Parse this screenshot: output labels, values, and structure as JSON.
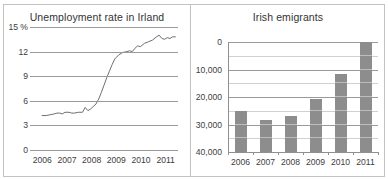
{
  "chart_data": [
    {
      "type": "line",
      "title": "Unemployment rate in Irland",
      "xlabel": "",
      "ylabel": "15 %",
      "ylim": [
        0,
        15
      ],
      "yticks": [
        0,
        3,
        6,
        9,
        12,
        15
      ],
      "ytick_labels": [
        "0",
        "3",
        "6",
        "9",
        "12",
        "15 %"
      ],
      "xlim": [
        2006,
        2011.5
      ],
      "xtick_labels": [
        "2006",
        "2007",
        "2008",
        "2009",
        "2010",
        "2011"
      ],
      "grid": true,
      "legend": "none",
      "series": [
        {
          "name": "Unemployment rate",
          "x": [
            2006.45,
            2006.6,
            2006.75,
            2006.9,
            2007.0,
            2007.1,
            2007.2,
            2007.3,
            2007.45,
            2007.55,
            2007.65,
            2007.8,
            2007.95,
            2008.05,
            2008.15,
            2008.25,
            2008.35,
            2008.45,
            2008.55,
            2008.65,
            2008.75,
            2008.85,
            2008.95,
            2009.05,
            2009.15,
            2009.3,
            2009.45,
            2009.6,
            2009.7,
            2009.8,
            2009.9,
            2010.0,
            2010.1,
            2010.25,
            2010.4,
            2010.55,
            2010.7,
            2010.8,
            2010.9,
            2011.0,
            2011.1,
            2011.2,
            2011.3,
            2011.4
          ],
          "y": [
            4.2,
            4.2,
            4.3,
            4.4,
            4.5,
            4.5,
            4.4,
            4.6,
            4.6,
            4.5,
            4.5,
            4.6,
            4.6,
            5.2,
            4.8,
            5.0,
            5.3,
            5.6,
            6.2,
            7.0,
            7.9,
            8.8,
            9.6,
            10.4,
            11.1,
            11.6,
            11.9,
            12.0,
            12.1,
            12.0,
            12.4,
            12.7,
            12.6,
            13.0,
            13.2,
            13.4,
            13.8,
            14.0,
            13.6,
            13.5,
            13.7,
            13.6,
            13.8,
            13.8
          ]
        }
      ]
    },
    {
      "type": "bar",
      "title": "Irish emigrants",
      "xlabel": "",
      "ylabel": "",
      "ylim": [
        0,
        40000
      ],
      "yticks": [
        0,
        10000,
        20000,
        30000,
        40000
      ],
      "ytick_labels": [
        "0",
        "10,000",
        "20,000",
        "30,000",
        "40,000"
      ],
      "minor_yticks": [
        5000,
        15000,
        25000,
        35000
      ],
      "categories": [
        "2006",
        "2007",
        "2008",
        "2009",
        "2010",
        "2011"
      ],
      "values": [
        15000,
        11800,
        13000,
        19200,
        28200,
        40000
      ],
      "grid": true,
      "legend": "none",
      "bar_color": "#8d8d8d"
    }
  ],
  "left_chart": {
    "title": "Unemployment rate in Irland",
    "ytick_labels": [
      "15 %",
      "12",
      "9",
      "6",
      "3",
      "0"
    ],
    "xtick_labels": [
      "2006",
      "2007",
      "2008",
      "2009",
      "2010",
      "2011"
    ]
  },
  "right_chart": {
    "title": "Irish emigrants",
    "ytick_labels": [
      "40,000",
      "30,000",
      "20,000",
      "10,000",
      "0"
    ],
    "xtick_labels": [
      "2006",
      "2007",
      "2008",
      "2009",
      "2010",
      "2011"
    ]
  },
  "colors": {
    "bar": "#8d8d8d",
    "gridline": "#9a9a9a",
    "gridline_minor": "#d0d0d0",
    "frame": "#c3c3c3",
    "line": "#6e6e6e",
    "text": "#3d3d3d"
  }
}
